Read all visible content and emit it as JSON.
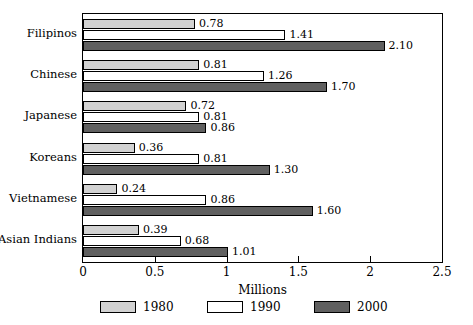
{
  "chart_data": {
    "type": "bar",
    "orientation": "horizontal",
    "title": "",
    "xlabel": "Millions",
    "ylabel": "",
    "xlim": [
      0,
      2.5
    ],
    "xticks": [
      "0",
      "0.5",
      "1",
      "1.5",
      "2",
      "2.5"
    ],
    "xtick_values": [
      0,
      0.5,
      1,
      1.5,
      2,
      2.5
    ],
    "grid": false,
    "legend_position": "bottom",
    "categories": [
      "Filipinos",
      "Chinese",
      "Japanese",
      "Koreans",
      "Vietnamese",
      "Asian Indians"
    ],
    "series": [
      {
        "name": "1980",
        "color": "#d2d2d2",
        "values": [
          0.78,
          0.81,
          0.72,
          0.36,
          0.24,
          0.39
        ],
        "labels": [
          "0.78",
          "0.81",
          "0.72",
          "0.36",
          "0.24",
          "0.39"
        ]
      },
      {
        "name": "1990",
        "color": "#ffffff",
        "values": [
          1.41,
          1.26,
          0.81,
          0.81,
          0.86,
          0.68
        ],
        "labels": [
          "1.41",
          "1.26",
          "0.81",
          "0.81",
          "0.86",
          "0.68"
        ]
      },
      {
        "name": "2000",
        "color": "#606060",
        "values": [
          2.1,
          1.7,
          0.86,
          1.3,
          1.6,
          1.01
        ],
        "labels": [
          "2.10",
          "1.70",
          "0.86",
          "1.30",
          "1.60",
          "1.01"
        ]
      }
    ]
  },
  "legend": {
    "items": [
      {
        "label": "1980",
        "swatch": "s1980"
      },
      {
        "label": "1990",
        "swatch": "s1990"
      },
      {
        "label": "2000",
        "swatch": "s2000"
      }
    ]
  },
  "axis": {
    "x_title": "Millions"
  },
  "colors": {
    "series_1980": "#d2d2d2",
    "series_1990": "#ffffff",
    "series_2000": "#606060",
    "outline": "#000000",
    "background": "#ffffff"
  }
}
